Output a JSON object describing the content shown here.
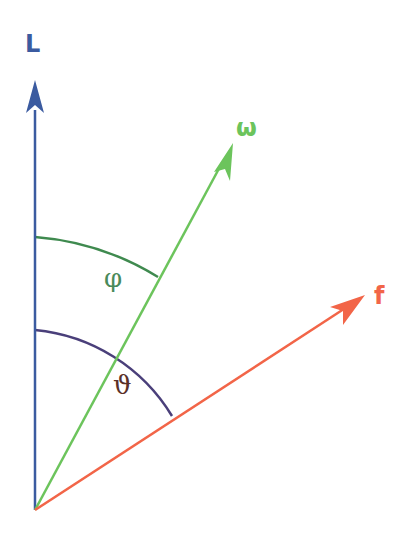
{
  "diagram": {
    "type": "vector-angle-diagram",
    "origin": [
      35,
      510
    ],
    "colors": {
      "L": "#3b5ba0",
      "omega": "#6cc45c",
      "f": "#f26548",
      "phi_arc": "#3f8a4f",
      "theta_arc": "#4a3f7a",
      "phi_label": "#4a8a5a",
      "theta_label": "#5a3028"
    },
    "vectors": [
      {
        "id": "L",
        "label": "L",
        "tip": [
          35,
          80
        ]
      },
      {
        "id": "omega",
        "label": "ω",
        "tip": [
          233,
          143
        ]
      },
      {
        "id": "f",
        "label": "f",
        "tip": [
          365,
          295
        ]
      }
    ],
    "angles": [
      {
        "id": "phi",
        "label": "φ",
        "between": [
          "L",
          "omega"
        ]
      },
      {
        "id": "theta",
        "label": "ϑ",
        "between": [
          "L",
          "f"
        ]
      }
    ]
  }
}
